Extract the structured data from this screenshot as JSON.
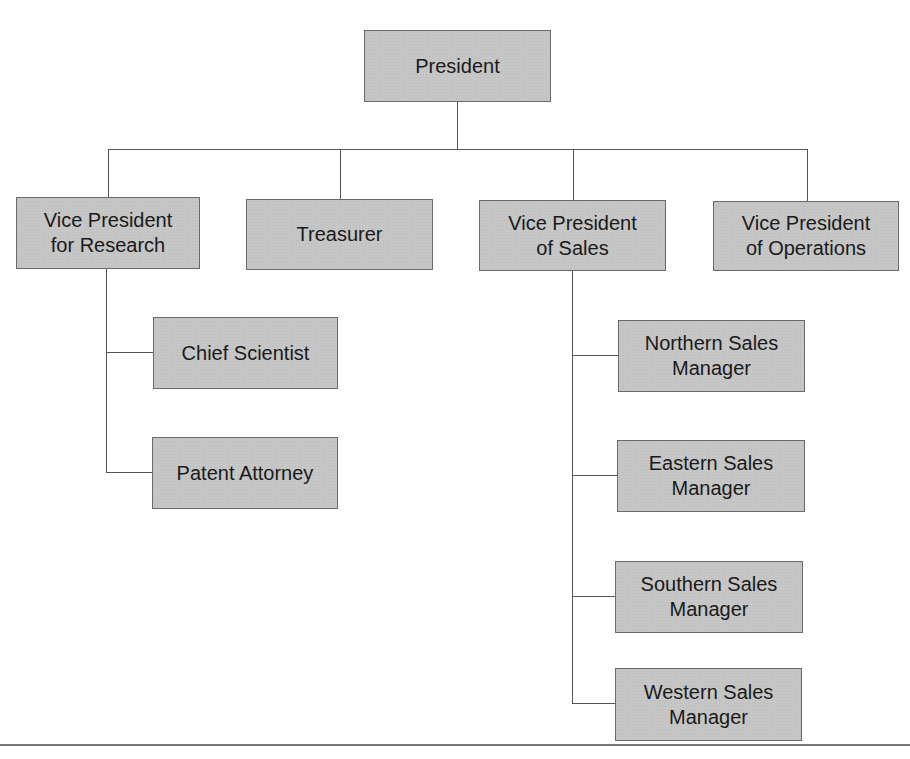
{
  "diagram": {
    "type": "organization-chart",
    "nodes": [
      {
        "id": "president",
        "label": "President",
        "parent": null
      },
      {
        "id": "vp-research",
        "label": "Vice President\nfor Research",
        "parent": "president"
      },
      {
        "id": "treasurer",
        "label": "Treasurer",
        "parent": "president"
      },
      {
        "id": "vp-sales",
        "label": "Vice President\nof Sales",
        "parent": "president"
      },
      {
        "id": "vp-operations",
        "label": "Vice President\nof Operations",
        "parent": "president"
      },
      {
        "id": "chief-scientist",
        "label": "Chief Scientist",
        "parent": "vp-research"
      },
      {
        "id": "patent-attorney",
        "label": "Patent Attorney",
        "parent": "vp-research"
      },
      {
        "id": "northern-sales",
        "label": "Northern Sales\nManager",
        "parent": "vp-sales"
      },
      {
        "id": "eastern-sales",
        "label": "Eastern Sales\nManager",
        "parent": "vp-sales"
      },
      {
        "id": "southern-sales",
        "label": "Southern Sales\nManager",
        "parent": "vp-sales"
      },
      {
        "id": "western-sales",
        "label": "Western Sales\nManager",
        "parent": "vp-sales"
      }
    ]
  },
  "labels": {
    "president": "President",
    "vp_research": "Vice President\nfor Research",
    "treasurer": "Treasurer",
    "vp_sales": "Vice President\nof Sales",
    "vp_operations": "Vice President\nof Operations",
    "chief_scientist": "Chief Scientist",
    "patent_attorney": "Patent Attorney",
    "northern_sales": "Northern Sales\nManager",
    "eastern_sales": "Eastern Sales\nManager",
    "southern_sales": "Southern Sales\nManager",
    "western_sales": "Western Sales\nManager"
  },
  "colors": {
    "box_fill": "#c6c6c6",
    "box_border": "#6a6a6a",
    "connector": "#555555",
    "text": "#1a1a1a"
  }
}
